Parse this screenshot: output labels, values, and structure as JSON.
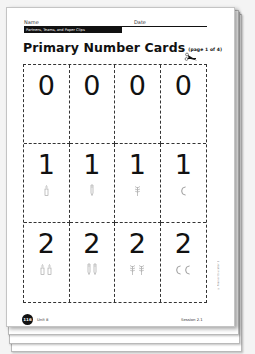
{
  "header": {
    "name_label": "Name",
    "date_label": "Date",
    "banner": "Partners, Teams, and Paper Clips"
  },
  "title": {
    "main": "Primary Number Cards",
    "sub": "(page 1 of 4)"
  },
  "cards": [
    {
      "digit": "0",
      "icon": "none",
      "count": 0
    },
    {
      "digit": "0",
      "icon": "none",
      "count": 0
    },
    {
      "digit": "0",
      "icon": "none",
      "count": 0
    },
    {
      "digit": "0",
      "icon": "none",
      "count": 0
    },
    {
      "digit": "1",
      "icon": "candle-icon",
      "count": 1
    },
    {
      "digit": "1",
      "icon": "crayon-icon",
      "count": 1
    },
    {
      "digit": "1",
      "icon": "flower-icon",
      "count": 1
    },
    {
      "digit": "1",
      "icon": "moon-icon",
      "count": 1
    },
    {
      "digit": "2",
      "icon": "candle-icon",
      "count": 2
    },
    {
      "digit": "2",
      "icon": "crayon-icon",
      "count": 2
    },
    {
      "digit": "2",
      "icon": "flower-icon",
      "count": 2
    },
    {
      "digit": "2",
      "icon": "moon-icon",
      "count": 2
    }
  ],
  "side_note": "© Pearson Education 2",
  "footer": {
    "page_number": "116",
    "unit": "Unit 8",
    "session": "Session 2.1"
  },
  "colors": {
    "ink": "#111111",
    "icon_gray": "#9a9a9a",
    "background": "#f4f4f4"
  }
}
